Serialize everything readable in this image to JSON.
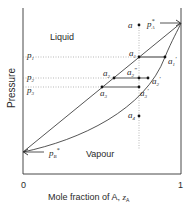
{
  "diagram": {
    "title": "",
    "xlabel": "Mole fraction of A, ",
    "xlabel_var": "z",
    "xlabel_sub": "A",
    "ylabel": "Pressure",
    "x_ticks": [
      "0",
      "1"
    ],
    "regions": {
      "liquid": "Liquid",
      "vapour": "Vapour"
    },
    "pressure_labels": [
      {
        "base": "p",
        "sub": "1"
      },
      {
        "base": "p",
        "sub": "2"
      },
      {
        "base": "p",
        "sub": "3"
      }
    ],
    "endpoints": {
      "pA": {
        "base": "p",
        "sub": "A",
        "sup": "*"
      },
      "pB": {
        "base": "p",
        "sub": "B",
        "sup": "*"
      }
    },
    "points": [
      {
        "id": "a",
        "base": "a",
        "sub": "",
        "prime": ""
      },
      {
        "id": "a1",
        "base": "a",
        "sub": "1",
        "prime": ""
      },
      {
        "id": "a1p",
        "base": "a",
        "sub": "1",
        "prime": "′"
      },
      {
        "id": "a2",
        "base": "a",
        "sub": "2",
        "prime": ""
      },
      {
        "id": "a2pp",
        "base": "a",
        "sub": "2",
        "prime": "″"
      },
      {
        "id": "a2p",
        "base": "a",
        "sub": "2",
        "prime": "′"
      },
      {
        "id": "a3",
        "base": "a",
        "sub": "3",
        "prime": ""
      },
      {
        "id": "a3p",
        "base": "a",
        "sub": "3",
        "prime": "′"
      },
      {
        "id": "a4",
        "base": "a",
        "sub": "4",
        "prime": ""
      }
    ]
  },
  "colors": {
    "line": "#2a2a2a",
    "tie_line": "#555555",
    "dotted": "#888888",
    "axis": "#333333"
  }
}
